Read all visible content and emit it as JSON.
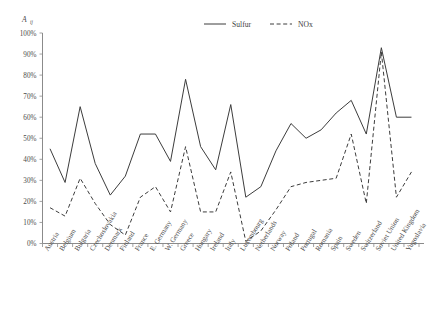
{
  "chart_data": {
    "type": "line",
    "title": "",
    "subtitle": "",
    "xlabel": "",
    "ylabel": "A",
    "ylabel_subscript": "ij",
    "ylim": [
      0,
      100
    ],
    "ytick_labels": [
      "0%",
      "10%",
      "20%",
      "30%",
      "40%",
      "50%",
      "60%",
      "70%",
      "80%",
      "90%",
      "100%"
    ],
    "ytick_values": [
      0,
      10,
      20,
      30,
      40,
      50,
      60,
      70,
      80,
      90,
      100
    ],
    "grid": false,
    "legend_position": "top-center",
    "categories": [
      "Austria",
      "Belgium",
      "Bulgaria",
      "Czechoslovakia",
      "Denmark",
      "Finland",
      "France",
      "E. Germany",
      "W. Germany",
      "Greece",
      "Hungary",
      "Ireland",
      "Italy",
      "Luxembourg",
      "Netherlands",
      "Norway",
      "Poland",
      "Portugal",
      "Romania",
      "Spain",
      "Sweden",
      "Switzerland",
      "Soviet Union",
      "United Kingdom",
      "Yugoslavia"
    ],
    "series": [
      {
        "name": "Sulfur",
        "style": "solid",
        "color": "#3c3c3c",
        "values": [
          45,
          29,
          65,
          38,
          23,
          32,
          52,
          52,
          39,
          78,
          46,
          35,
          66,
          22,
          27,
          44,
          57,
          50,
          54,
          62,
          68,
          52,
          93,
          60,
          60
        ]
      },
      {
        "name": "NOx",
        "style": "dashed",
        "color": "#3c3c3c",
        "values": [
          17,
          13,
          31,
          19,
          9,
          4,
          22,
          27,
          15,
          46,
          15,
          15,
          34,
          1,
          6,
          16,
          27,
          29,
          30,
          31,
          52,
          19,
          91,
          22,
          34
        ]
      }
    ]
  },
  "legend": {
    "entries": [
      {
        "label": "Sulfur",
        "style": "solid"
      },
      {
        "label": "NOx",
        "style": "dashed"
      }
    ]
  }
}
